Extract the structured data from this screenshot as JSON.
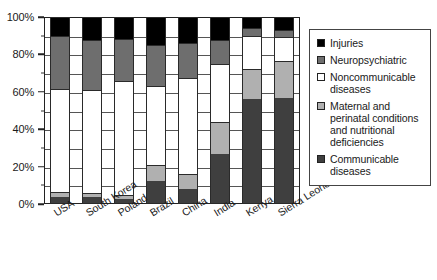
{
  "chart_data": {
    "type": "bar",
    "subtype": "stacked-100-percent",
    "title": "",
    "xlabel": "",
    "ylabel": "",
    "ylim": [
      0,
      100
    ],
    "ytick_labels": [
      "0%",
      "20%",
      "40%",
      "60%",
      "80%",
      "100%"
    ],
    "ytick_values": [
      0,
      20,
      40,
      60,
      80,
      100
    ],
    "minor_tick_values": [
      10,
      30,
      50,
      70,
      90
    ],
    "grid": true,
    "grid_axis": "y",
    "legend_position": "right",
    "categories": [
      "USA",
      "South Korea",
      "Poland",
      "Brazil",
      "China",
      "India",
      "Kenya",
      "Sierra Leone"
    ],
    "series": [
      {
        "name": "Communicable diseases",
        "color": "#3f3f3f",
        "values": [
          3.5,
          4,
          2.5,
          12.5,
          8,
          26.5,
          56,
          56.5
        ]
      },
      {
        "name": "Maternal and perinatal conditions and nutritional deficiencies",
        "color": "#b0b0b0",
        "values": [
          3,
          2,
          2.5,
          8.5,
          8,
          17.5,
          16,
          20
        ]
      },
      {
        "name": "Noncommunicable diseases",
        "color": "#ffffff",
        "values": [
          55,
          55,
          61,
          42,
          51.5,
          31,
          18,
          13
        ]
      },
      {
        "name": "Neuropsychiatric",
        "color": "#6e6e6e",
        "values": [
          28.5,
          26.5,
          22,
          22,
          18.5,
          12.5,
          4,
          3.5
        ]
      },
      {
        "name": "Injuries",
        "color": "#000000",
        "values": [
          10,
          12.5,
          12,
          15,
          14,
          12.5,
          6,
          7
        ]
      }
    ]
  },
  "legend": {
    "items": [
      {
        "label": "Injuries",
        "color": "#000000"
      },
      {
        "label": "Neuropsychiatric",
        "color": "#6e6e6e"
      },
      {
        "label": "Noncommunicable diseases",
        "color": "#ffffff"
      },
      {
        "label": "Maternal and perinatal conditions and nutritional deficiencies",
        "color": "#b0b0b0"
      },
      {
        "label": "Communicable diseases",
        "color": "#3f3f3f"
      }
    ]
  }
}
